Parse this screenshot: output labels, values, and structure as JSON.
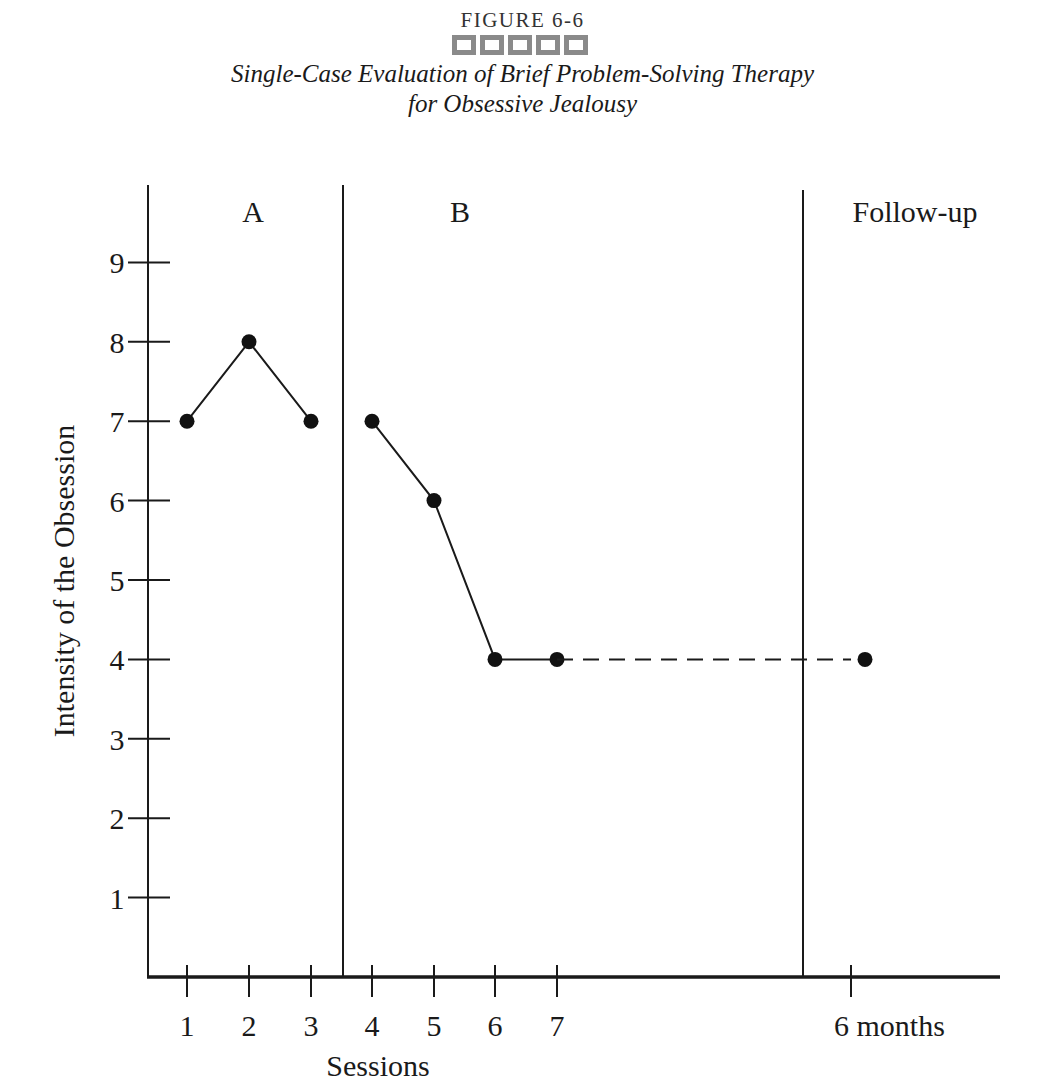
{
  "figure": {
    "label": "FIGURE 6-6",
    "title_line1": "Single-Case Evaluation of Brief Problem-Solving Therapy",
    "title_line2": "for Obsessive Jealousy",
    "decor_squares": 5,
    "decor_color": "#8a8a8a"
  },
  "chart_data": {
    "type": "line",
    "xlabel": "Sessions",
    "ylabel": "Intensity of the Obsession",
    "ylim": [
      0,
      9
    ],
    "yticks": [
      1,
      2,
      3,
      4,
      5,
      6,
      7,
      8,
      9
    ],
    "xticks": [
      {
        "label": "1",
        "pos": 187
      },
      {
        "label": "2",
        "pos": 249
      },
      {
        "label": "3",
        "pos": 311
      },
      {
        "label": "4",
        "pos": 372
      },
      {
        "label": "5",
        "pos": 434
      },
      {
        "label": "6",
        "pos": 495
      },
      {
        "label": "7",
        "pos": 557
      },
      {
        "label": "6 months",
        "pos": 851
      }
    ],
    "phases": [
      {
        "label": "A",
        "label_x": 253
      },
      {
        "label": "B",
        "label_x": 460
      },
      {
        "label": "Follow-up",
        "label_x": 915
      }
    ],
    "phase_dividers": [
      {
        "x": 343,
        "top": 185
      },
      {
        "x": 803,
        "top": 190
      }
    ],
    "series": [
      {
        "name": "Baseline (A)",
        "style": "solid",
        "points": [
          {
            "session": "1",
            "value": 7
          },
          {
            "session": "2",
            "value": 8
          },
          {
            "session": "3",
            "value": 7
          }
        ]
      },
      {
        "name": "Intervention (B)",
        "style": "solid",
        "points": [
          {
            "session": "4",
            "value": 7
          },
          {
            "session": "5",
            "value": 6
          },
          {
            "session": "6",
            "value": 4
          },
          {
            "session": "7",
            "value": 4
          }
        ]
      },
      {
        "name": "Follow-up connector",
        "style": "dashed",
        "points": [
          {
            "session": "7",
            "value": 4
          },
          {
            "session": "6 months",
            "value": 4
          }
        ]
      },
      {
        "name": "Follow-up",
        "style": "marker",
        "points": [
          {
            "session": "6 months",
            "value": 4,
            "x_offset": 14
          }
        ]
      }
    ],
    "grid": false,
    "legend": null
  }
}
